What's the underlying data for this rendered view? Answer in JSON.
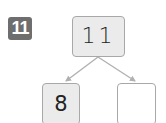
{
  "problem": {
    "number": "11",
    "badge_color": "#6e6e6e"
  },
  "number_bond": {
    "whole": "11",
    "parts": [
      {
        "value": "8",
        "filled": true
      },
      {
        "value": "",
        "filled": false
      }
    ]
  },
  "colors": {
    "box_fill": "#ebebeb",
    "box_border": "#a8a8a8",
    "arrow": "#b0b0b0"
  }
}
